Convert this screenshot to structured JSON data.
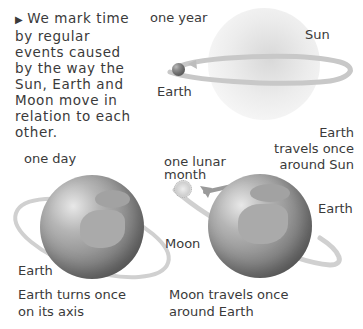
{
  "intro": {
    "marker": "▶",
    "text": "We mark time by regular events caused by the way the Sun, Earth and Moon move in relation to each other."
  },
  "panel_year": {
    "period_label": "one year",
    "sun_label": "Sun",
    "earth_label": "Earth",
    "caption": [
      "Earth",
      "travels once",
      "around Sun"
    ]
  },
  "panel_day": {
    "period_label": "one day",
    "earth_label": "Earth",
    "caption": [
      "Earth turns once",
      "on its axis"
    ]
  },
  "panel_month": {
    "period_label": [
      "one lunar",
      "month"
    ],
    "moon_label": "Moon",
    "earth_label": "Earth",
    "caption": [
      "Moon travels once",
      "around Earth"
    ]
  },
  "colors": {
    "text": "#3a3a3a",
    "orbit": "#c8c8c8",
    "globe": "#8c8c8c"
  }
}
